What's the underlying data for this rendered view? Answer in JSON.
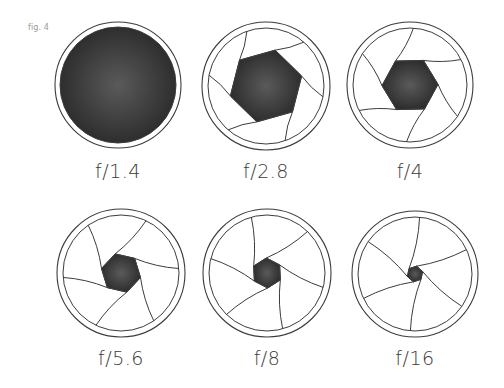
{
  "figure": {
    "label": "fig. 4",
    "colors": {
      "stroke": "#3c3c3c",
      "fill": "#2e2e2e",
      "fill_light": "#5a5a5a",
      "text": "#3a3a3a",
      "fig_label": "#9a9a9a"
    },
    "apertures": [
      {
        "id": "f1-4",
        "label": "f/1.4",
        "cx": 118,
        "cy": 85,
        "r": 63,
        "open_fraction": 1.0,
        "hex_r": 0,
        "blades": 0,
        "label_y": 160
      },
      {
        "id": "f2-8",
        "label": "f/2.8",
        "cx": 266,
        "cy": 86,
        "r": 64,
        "open_fraction": 0.55,
        "hex_r": 37,
        "blades": 6,
        "label_y": 160
      },
      {
        "id": "f4",
        "label": "f/4",
        "cx": 410,
        "cy": 85,
        "r": 63,
        "open_fraction": 0.42,
        "hex_r": 28,
        "blades": 6,
        "label_y": 160
      },
      {
        "id": "f5-6",
        "label": "f/5.6",
        "cx": 121,
        "cy": 273,
        "r": 64,
        "open_fraction": 0.3,
        "hex_r": 20,
        "blades": 6,
        "label_y": 347
      },
      {
        "id": "f8",
        "label": "f/8",
        "cx": 267,
        "cy": 273,
        "r": 64,
        "open_fraction": 0.22,
        "hex_r": 15,
        "blades": 6,
        "label_y": 347
      },
      {
        "id": "f16",
        "label": "f/16",
        "cx": 415,
        "cy": 274,
        "r": 63,
        "open_fraction": 0.12,
        "hex_r": 8,
        "blades": 6,
        "label_y": 347
      }
    ]
  }
}
